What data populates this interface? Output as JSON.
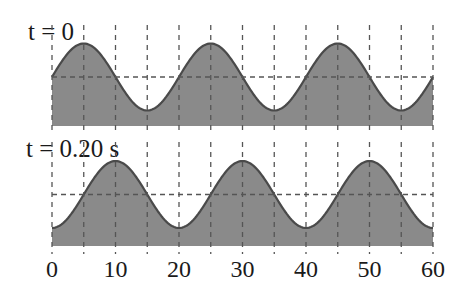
{
  "chart_data": {
    "type": "area",
    "title": "",
    "xlabel": "",
    "ylabel": "",
    "x_ticks": [
      0,
      10,
      20,
      30,
      40,
      50,
      60
    ],
    "x_gridlines": [
      0,
      5,
      10,
      15,
      20,
      25,
      30,
      35,
      40,
      45,
      50,
      55,
      60
    ],
    "xlim": [
      0,
      60
    ],
    "grid": "dashed",
    "wavelength": 20,
    "panels": [
      {
        "label": "t = 0",
        "time_s": 0,
        "crest_positions": [
          5,
          25,
          45
        ],
        "trough_positions": [
          15,
          35,
          55
        ],
        "function": "y = 1 + A sin(2π(x)/20)"
      },
      {
        "label": "t = 0.20 s",
        "time_s": 0.2,
        "crest_positions": [
          10,
          30,
          50
        ],
        "trough_positions": [
          0,
          20,
          40,
          60
        ],
        "function": "y = 1 + A sin(2π(x-5)/20)"
      }
    ],
    "colors": {
      "fill": "#8a8a8a",
      "curve": "#4a4a4a",
      "grid": "#555555"
    }
  }
}
